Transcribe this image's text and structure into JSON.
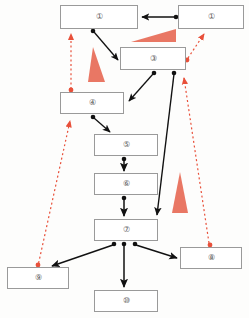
{
  "diagram": {
    "canvas": {
      "width": 249,
      "height": 318,
      "background": "#fdfdfc"
    },
    "colors": {
      "node_border": "#9a9a9a",
      "node_fill": "#ffffff",
      "label_text": "#5a5a5a",
      "solid_edge": "#111111",
      "dashed_edge": "#e8503a",
      "wedge_fill": "#e8705c"
    },
    "nodes": [
      {
        "id": "n1a",
        "label": "①",
        "x": 60,
        "y": 5,
        "w": 78,
        "h": 24
      },
      {
        "id": "n1b",
        "label": "①",
        "x": 178,
        "y": 5,
        "w": 66,
        "h": 24
      },
      {
        "id": "n3",
        "label": "③",
        "x": 120,
        "y": 47,
        "w": 66,
        "h": 23
      },
      {
        "id": "n4",
        "label": "④",
        "x": 60,
        "y": 92,
        "w": 64,
        "h": 22
      },
      {
        "id": "n5",
        "label": "⑤",
        "x": 94,
        "y": 134,
        "w": 64,
        "h": 22
      },
      {
        "id": "n6",
        "label": "⑥",
        "x": 94,
        "y": 173,
        "w": 64,
        "h": 22
      },
      {
        "id": "n7",
        "label": "⑦",
        "x": 94,
        "y": 219,
        "w": 64,
        "h": 22
      },
      {
        "id": "n8",
        "label": "⑧",
        "x": 180,
        "y": 247,
        "w": 62,
        "h": 22
      },
      {
        "id": "n9",
        "label": "⑨",
        "x": 7,
        "y": 267,
        "w": 62,
        "h": 22
      },
      {
        "id": "n10",
        "label": "⑩",
        "x": 94,
        "y": 290,
        "w": 64,
        "h": 22
      }
    ],
    "solid_edges": [
      {
        "name": "edge-n1b-to-n1a",
        "from": "n1b",
        "to": "n1a",
        "kind": "double-headed"
      },
      {
        "name": "edge-n1a-to-n3",
        "from": "n1a",
        "to": "n3",
        "kind": "single"
      },
      {
        "name": "edge-n3-to-n4",
        "from": "n3",
        "to": "n4",
        "kind": "single"
      },
      {
        "name": "edge-n4-to-n5",
        "from": "n4",
        "to": "n5",
        "kind": "single"
      },
      {
        "name": "edge-n5-to-n6",
        "from": "n5",
        "to": "n6",
        "kind": "single"
      },
      {
        "name": "edge-n6-to-n7",
        "from": "n6",
        "to": "n7",
        "kind": "single"
      },
      {
        "name": "edge-n3-to-n7",
        "from": "n3",
        "to": "n7",
        "kind": "single"
      },
      {
        "name": "edge-n7-to-n9",
        "from": "n7",
        "to": "n9",
        "kind": "single"
      },
      {
        "name": "edge-n7-to-n8",
        "from": "n7",
        "to": "n8",
        "kind": "single"
      },
      {
        "name": "edge-n7-to-n10",
        "from": "n7",
        "to": "n10",
        "kind": "single"
      }
    ],
    "dashed_edges": [
      {
        "name": "dashed-n4-to-n1a",
        "from": "n4",
        "to": "n1a"
      },
      {
        "name": "dashed-n3-to-n1b",
        "from": "n3",
        "to": "n1b"
      },
      {
        "name": "dashed-n8-to-n3",
        "from": "n8",
        "to": "n3"
      },
      {
        "name": "dashed-n9-to-n4",
        "from": "n9",
        "to": "n4"
      }
    ],
    "wedges": [
      {
        "name": "wedge-top-horizontal",
        "orientation": "horizontal-right"
      },
      {
        "name": "wedge-left-vertical",
        "orientation": "vertical"
      },
      {
        "name": "wedge-right-vertical",
        "orientation": "vertical"
      }
    ]
  }
}
